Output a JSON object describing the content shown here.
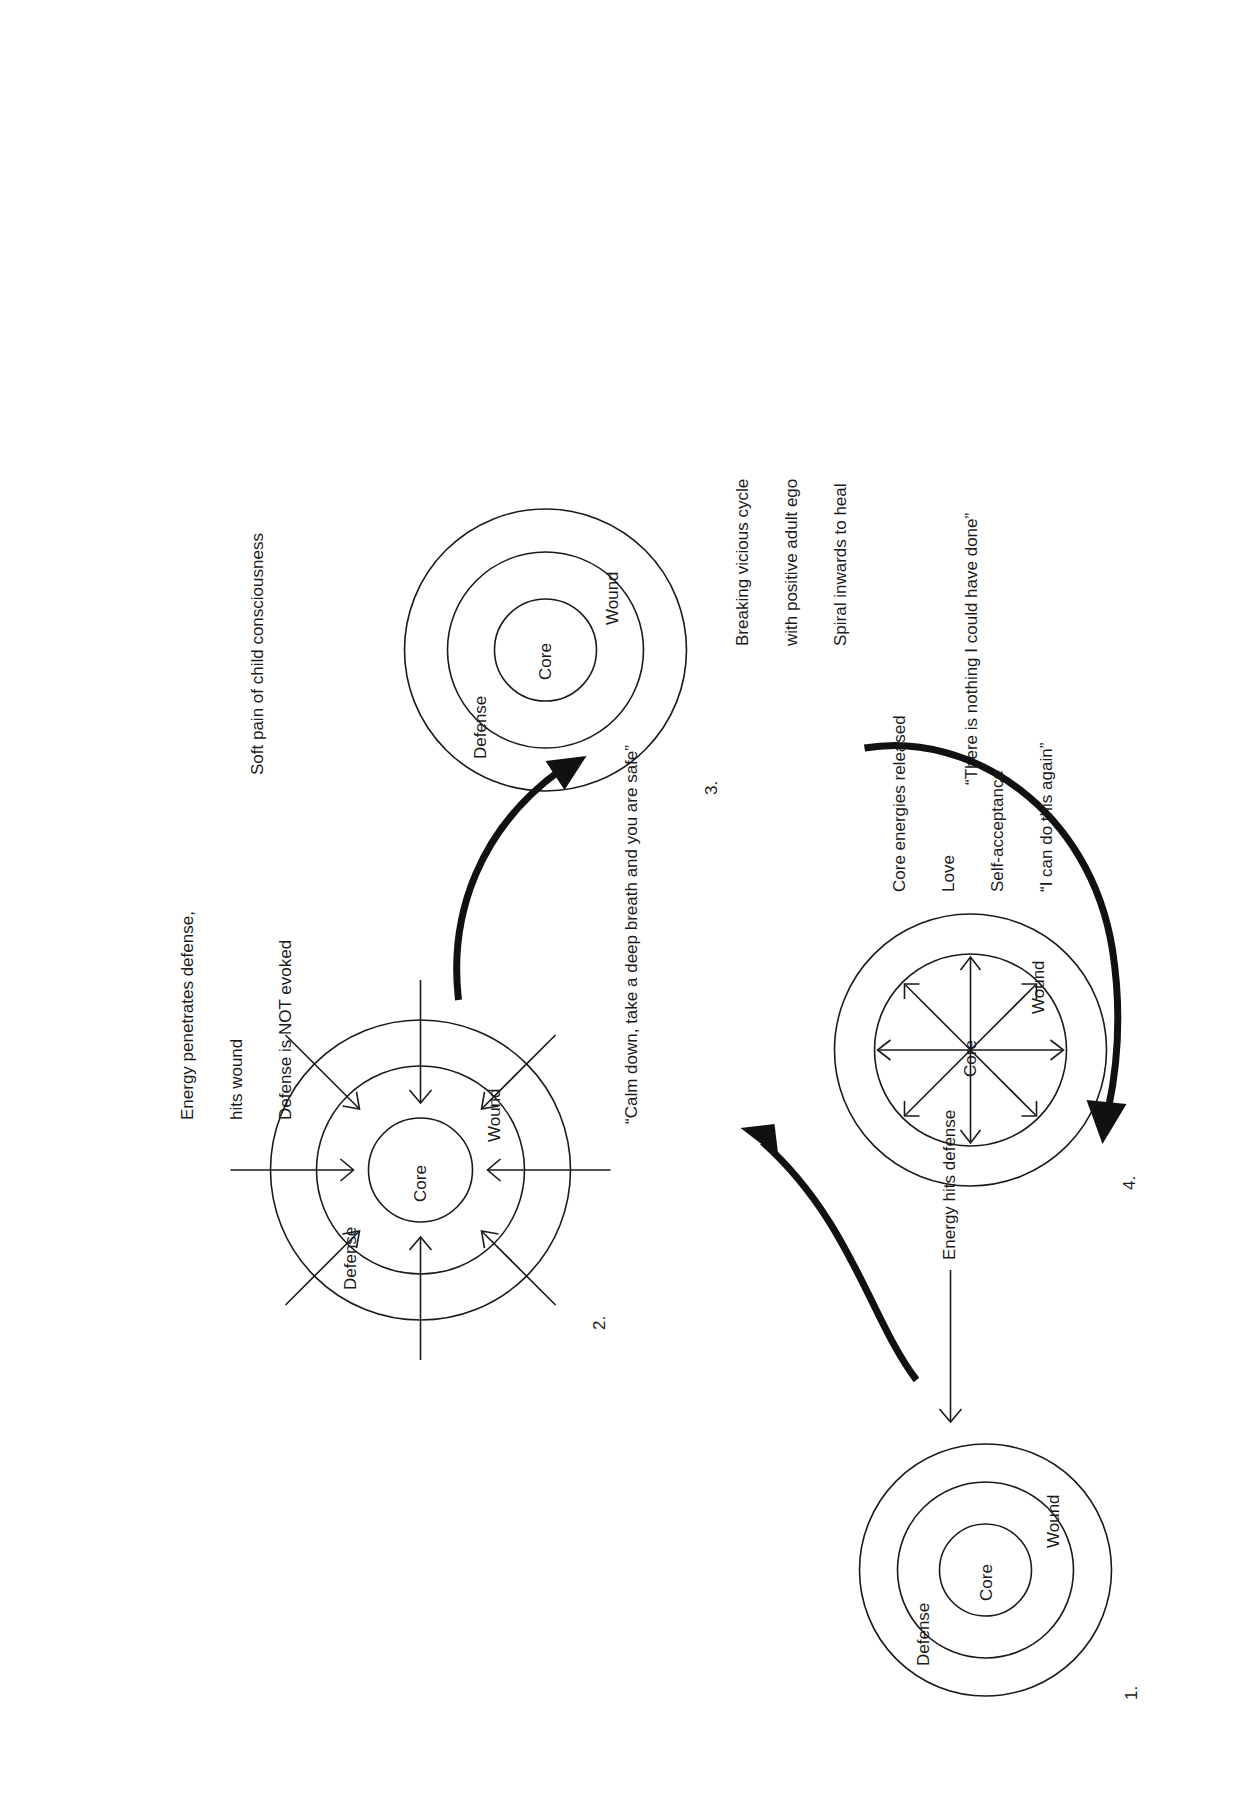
{
  "diagram": {
    "ring_labels": {
      "defense": "Defense",
      "wound": "Wound",
      "core": "Core"
    },
    "ink_color": "#1a1a1a",
    "background": "#ffffff"
  },
  "steps": [
    {
      "number": "1.",
      "rings": {
        "outer": "Defense",
        "middle": "Wound",
        "inner": "Core"
      },
      "caption": "Energy hits defense",
      "arrows": "single straight arrow pointing at defense ring"
    },
    {
      "number": "2.",
      "rings": {
        "outer": "Defense",
        "middle": "Wound",
        "inner": "Core"
      },
      "caption": "Energy penetrates defense,\nhits wound\nDefense is NOT evoked",
      "arrows": "eight inward arrows piercing the defense ring"
    },
    {
      "number": "3.",
      "rings": {
        "outer": "Defense",
        "middle": "Wound",
        "inner": "Core"
      },
      "caption_top": "Soft pain of child consciousness",
      "caption_bottom": "“There is nothing I could have done”",
      "arrows": "no arrows, quiet state"
    },
    {
      "number": "4.",
      "rings": {
        "outer": "Wound",
        "inner": "Core"
      },
      "caption": "Core energies released\nLove\nSelf-acceptance\n“I can do this again”",
      "arrows": "eight outward arrows radiating from the core"
    }
  ],
  "transitions": [
    {
      "id": "t1",
      "from": "1",
      "to": "2",
      "label": "",
      "style": "thick curved arrow"
    },
    {
      "id": "t2",
      "from": "2",
      "to": "3",
      "label": "“Calm down, take a deep breath and you are safe”",
      "style": "thick curved arrow"
    },
    {
      "id": "t3",
      "from": "3",
      "to": "4",
      "label": "Breaking vicious cycle\nwith positive adult ego\nSpiral inwards to heal",
      "style": "thick curved arrow"
    }
  ],
  "labels": {
    "step1_number": "1.",
    "step2_number": "2.",
    "step3_number": "3.",
    "step4_number": "4.",
    "energy_hits_defense": "Energy hits defense",
    "energy_penetrates_line1": "Energy penetrates defense,",
    "energy_penetrates_line2": "hits wound",
    "energy_penetrates_line3": "Defense is NOT evoked",
    "calm_down": "“Calm down, take a deep breath and you are safe”",
    "soft_pain": "Soft pain of child consciousness",
    "nothing_i_could_have_done": "“There is nothing I could have done”",
    "breaking_cycle_line1": "Breaking vicious cycle",
    "breaking_cycle_line2": "with positive adult ego",
    "breaking_cycle_line3": "Spiral inwards to heal",
    "core_released_line1": "Core energies released",
    "core_released_line2": "Love",
    "core_released_line3": "Self-acceptance",
    "core_released_line4": "“I can do this again”",
    "defense": "Defense",
    "wound": "Wound",
    "core": "Core"
  }
}
